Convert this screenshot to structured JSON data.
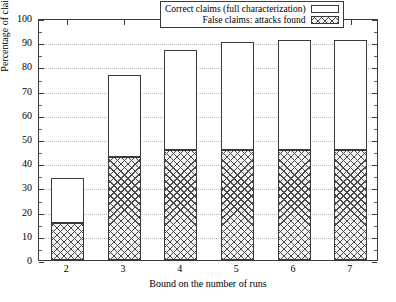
{
  "chart_data": {
    "type": "bar",
    "stacked": true,
    "title": "",
    "xlabel": "Bound on the number of runs",
    "ylabel": "Percentage of claims",
    "categories": [
      "2",
      "3",
      "4",
      "5",
      "6",
      "7"
    ],
    "ylim": [
      0,
      100
    ],
    "yticks": [
      0,
      10,
      20,
      30,
      40,
      50,
      60,
      70,
      80,
      90,
      100
    ],
    "grid": true,
    "legend_position": "top-right-inside",
    "series": [
      {
        "name": "False claims: attacks found",
        "fill": "cross-hatch",
        "color": "#4a4a4a",
        "values": [
          15.5,
          42.5,
          45.5,
          45.6,
          45.6,
          45.6
        ]
      },
      {
        "name": "Correct claims (full characterization)",
        "fill": "empty",
        "color": "#ffffff",
        "values": [
          18.5,
          34.0,
          41.2,
          44.4,
          45.4,
          45.4
        ]
      }
    ],
    "totals": [
      34.0,
      76.5,
      86.7,
      90.0,
      91.0,
      91.0
    ]
  },
  "legend": {
    "entries": [
      {
        "label": "Correct claims (full characterization)",
        "swatch": "empty-box"
      },
      {
        "label": "False claims: attacks found",
        "swatch": "cross-hatch-box"
      }
    ]
  },
  "axes": {
    "y_tick_labels": [
      "0",
      "10",
      "20",
      "30",
      "40",
      "50",
      "60",
      "70",
      "80",
      "90",
      "100"
    ],
    "x_tick_labels": [
      "2",
      "3",
      "4",
      "5",
      "6",
      "7"
    ],
    "y_title": "Percentage of claims",
    "x_title": "Bound on the number of runs"
  },
  "colors": {
    "axis": "#3a3a3a",
    "grid": "#b9b9b9",
    "hatch": "#4a4a4a",
    "background": "#ffffff"
  }
}
